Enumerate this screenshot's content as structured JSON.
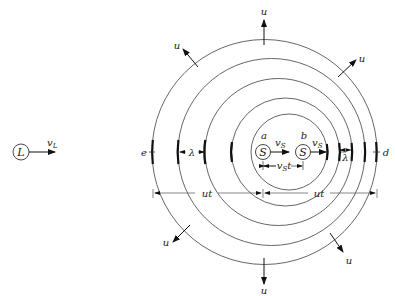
{
  "diagram": {
    "colors": {
      "line": "#555555",
      "ink": "#111111",
      "background": "#ffffff"
    },
    "listener": {
      "symbol": "L",
      "velocity_label": "v_L",
      "cx": 21,
      "cy": 152,
      "r": 8
    },
    "sources": [
      {
        "label": "a",
        "symbol": "S",
        "velocity_label": "v_S",
        "cx": 263,
        "cy": 152
      },
      {
        "label": "b",
        "symbol": "S",
        "velocity_label": "v_S",
        "cx": 303,
        "cy": 152
      }
    ],
    "source_displacement_label": "v_S t",
    "wavefronts": [
      {
        "cx": 264.5,
        "cy": 152,
        "r": 112.5
      },
      {
        "cx": 271.5,
        "cy": 152,
        "r": 93.5
      },
      {
        "cx": 278.5,
        "cy": 152,
        "r": 73.5
      },
      {
        "cx": 285.5,
        "cy": 152,
        "r": 54
      },
      {
        "cx": 289,
        "cy": 152,
        "r": 38
      },
      {
        "cx": 293,
        "cy": 152,
        "r": 24
      }
    ],
    "speed_label": "u",
    "points": {
      "left": "e",
      "right": "d"
    },
    "wavelength_label": "λ",
    "distance_label": "ut"
  }
}
